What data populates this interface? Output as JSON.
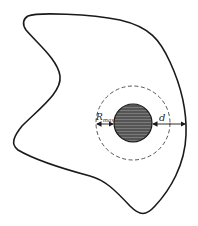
{
  "diagram": {
    "labels": {
      "rmax_main": "R",
      "rmax_sub": "max",
      "d": "d"
    },
    "colors": {
      "outline": "#1a1a1a",
      "disk_fill": "#555555",
      "disk_stripe": "#7a7a7a",
      "dashed_circle": "#444444",
      "background": "#ffffff"
    },
    "shapes": {
      "region": "irregular closed domain boundary",
      "inner_disk": "filled circle (obstacle)",
      "influence_circle": "dashed concentric circle",
      "arrow_rmax": "double arrow between dashed circle and disk (left)",
      "arrow_d": "double arrow from disk to domain boundary (right)"
    }
  }
}
